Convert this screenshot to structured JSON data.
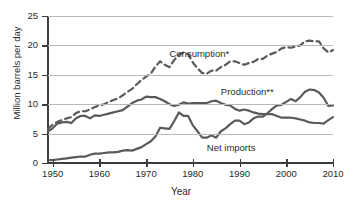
{
  "chart_data": {
    "type": "line",
    "title": "",
    "xlabel": "Year",
    "ylabel": "Million barrels per day",
    "xlim": [
      1949,
      2010
    ],
    "ylim": [
      0,
      25
    ],
    "xticks": [
      1950,
      1960,
      1970,
      1980,
      1990,
      2000,
      2010
    ],
    "xtick_labels": [
      "1950",
      "1960",
      "1970",
      "1980",
      "1990",
      "2000",
      "2010"
    ],
    "yticks": [
      0,
      5,
      10,
      15,
      20,
      25
    ],
    "ytick_labels": [
      "0",
      "5",
      "10",
      "15",
      "20",
      "25"
    ],
    "grid": "horizontal",
    "legend": "inline-annotations",
    "x": [
      1949,
      1950,
      1951,
      1952,
      1953,
      1954,
      1955,
      1956,
      1957,
      1958,
      1959,
      1960,
      1961,
      1962,
      1963,
      1964,
      1965,
      1966,
      1967,
      1968,
      1969,
      1970,
      1971,
      1972,
      1973,
      1974,
      1975,
      1976,
      1977,
      1978,
      1979,
      1980,
      1981,
      1982,
      1983,
      1984,
      1985,
      1986,
      1987,
      1988,
      1989,
      1990,
      1991,
      1992,
      1993,
      1994,
      1995,
      1996,
      1997,
      1998,
      1999,
      2000,
      2001,
      2002,
      2003,
      2004,
      2005,
      2006,
      2007,
      2008,
      2009,
      2010
    ],
    "series": [
      {
        "name": "Consumption*",
        "style": "dashed",
        "color": "#5a5a5a",
        "label_x": 1975,
        "label_y": 18.6,
        "values": [
          5.8,
          6.5,
          7.0,
          7.3,
          7.6,
          7.8,
          8.5,
          8.8,
          8.8,
          9.1,
          9.5,
          9.8,
          10.0,
          10.4,
          10.7,
          11.0,
          11.5,
          12.1,
          12.6,
          13.4,
          14.1,
          14.7,
          15.2,
          16.4,
          17.3,
          16.7,
          16.3,
          17.5,
          18.4,
          18.8,
          18.5,
          17.1,
          16.1,
          15.3,
          15.2,
          15.7,
          15.7,
          16.3,
          16.7,
          17.3,
          17.3,
          17.0,
          16.7,
          17.0,
          17.2,
          17.7,
          17.7,
          18.3,
          18.6,
          18.9,
          19.5,
          19.7,
          19.6,
          19.8,
          20.0,
          20.7,
          20.8,
          20.7,
          20.7,
          19.5,
          18.8,
          19.2
        ]
      },
      {
        "name": "Production**",
        "style": "solid",
        "color": "#5a5a5a",
        "label_x": 1986,
        "label_y": 12.0,
        "values": [
          5.4,
          5.9,
          6.7,
          6.9,
          7.0,
          6.8,
          7.6,
          8.0,
          8.0,
          7.6,
          8.1,
          8.0,
          8.2,
          8.4,
          8.6,
          8.8,
          9.0,
          9.6,
          10.2,
          10.6,
          10.8,
          11.3,
          11.2,
          11.2,
          10.9,
          10.5,
          10.0,
          9.7,
          9.9,
          10.3,
          10.1,
          10.2,
          10.2,
          10.2,
          10.2,
          10.5,
          10.6,
          10.2,
          9.9,
          9.8,
          9.2,
          8.9,
          9.1,
          8.9,
          8.6,
          8.4,
          8.3,
          8.3,
          8.3,
          8.0,
          7.7,
          7.7,
          7.7,
          7.6,
          7.4,
          7.2,
          6.9,
          6.8,
          6.8,
          6.7,
          7.3,
          7.8
        ]
      },
      {
        "name": "Net imports",
        "style": "solid",
        "color": "#5a5a5a",
        "label_x": 1983,
        "label_y": 2.6,
        "values": [
          0.5,
          0.5,
          0.6,
          0.7,
          0.8,
          0.9,
          1.0,
          1.1,
          1.1,
          1.4,
          1.6,
          1.6,
          1.7,
          1.8,
          1.8,
          1.9,
          2.1,
          2.2,
          2.1,
          2.4,
          2.7,
          3.2,
          3.7,
          4.5,
          6.0,
          5.9,
          5.8,
          7.1,
          8.6,
          8.0,
          8.0,
          6.4,
          5.4,
          4.3,
          4.3,
          4.7,
          4.3,
          5.4,
          5.9,
          6.6,
          7.2,
          7.2,
          6.6,
          6.9,
          7.6,
          7.9,
          7.9,
          8.5,
          9.2,
          9.8,
          9.9,
          10.4,
          10.9,
          10.5,
          11.2,
          12.1,
          12.5,
          12.4,
          12.0,
          11.1,
          9.7,
          9.8
        ]
      }
    ]
  }
}
